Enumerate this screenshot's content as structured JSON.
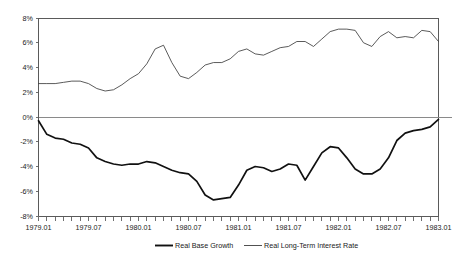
{
  "chart_data": {
    "type": "line",
    "title": "",
    "xlabel": "",
    "ylabel": "",
    "ylim": [
      -8,
      8
    ],
    "ytick_labels": [
      "8%",
      "6%",
      "4%",
      "2%",
      "0%",
      "-2%",
      "-4%",
      "-6%",
      "-8%"
    ],
    "ytick_values": [
      8,
      6,
      4,
      2,
      0,
      -2,
      -4,
      -6,
      -8
    ],
    "grid": false,
    "zero_line": true,
    "legend_position": "bottom",
    "x_axis_label_step_months": 6,
    "x_tick_step_months": 1,
    "xtick_labels": [
      "1979.01",
      "1979.07",
      "1980.01",
      "1980.07",
      "1981.01",
      "1981.07",
      "1982.01",
      "1982.07",
      "1983.01"
    ],
    "x": [
      "1979.01",
      "1979.02",
      "1979.03",
      "1979.04",
      "1979.05",
      "1979.06",
      "1979.07",
      "1979.08",
      "1979.09",
      "1979.10",
      "1979.11",
      "1979.12",
      "1980.01",
      "1980.02",
      "1980.03",
      "1980.04",
      "1980.05",
      "1980.06",
      "1980.07",
      "1980.08",
      "1980.09",
      "1980.10",
      "1980.11",
      "1980.12",
      "1981.01",
      "1981.02",
      "1981.03",
      "1981.04",
      "1981.05",
      "1981.06",
      "1981.07",
      "1981.08",
      "1981.09",
      "1981.10",
      "1981.11",
      "1981.12",
      "1982.01",
      "1982.02",
      "1982.03",
      "1982.04",
      "1982.05",
      "1982.06",
      "1982.07",
      "1982.08",
      "1982.09",
      "1982.10",
      "1982.11",
      "1982.12",
      "1983.01"
    ],
    "series": [
      {
        "name": "Real Base Growth",
        "color": "#111111",
        "line_width": "thick",
        "values": [
          -0.3,
          -1.4,
          -1.7,
          -1.8,
          -2.1,
          -2.2,
          -2.5,
          -3.3,
          -3.6,
          -3.8,
          -3.9,
          -3.8,
          -3.8,
          -3.6,
          -3.7,
          -4.0,
          -4.3,
          -4.5,
          -4.6,
          -5.2,
          -6.3,
          -6.7,
          -6.6,
          -6.5,
          -5.5,
          -4.3,
          -4.0,
          -4.1,
          -4.4,
          -4.2,
          -3.8,
          -3.9,
          -5.1,
          -4.0,
          -2.9,
          -2.4,
          -2.5,
          -3.3,
          -4.2,
          -4.6,
          -4.6,
          -4.2,
          -3.3,
          -1.9,
          -1.3,
          -1.1,
          -1.0,
          -0.8,
          -0.2
        ]
      },
      {
        "name": "Real Long-Term Interest Rate",
        "color": "#3d3d3d",
        "line_width": "thin",
        "values": [
          2.7,
          2.7,
          2.7,
          2.8,
          2.9,
          2.9,
          2.7,
          2.3,
          2.1,
          2.2,
          2.6,
          3.1,
          3.5,
          4.3,
          5.5,
          5.8,
          4.4,
          3.3,
          3.1,
          3.6,
          4.2,
          4.4,
          4.4,
          4.7,
          5.3,
          5.5,
          5.1,
          5.0,
          5.3,
          5.6,
          5.7,
          6.1,
          6.1,
          5.7,
          6.3,
          6.9,
          7.1,
          7.1,
          7.0,
          6.0,
          5.7,
          6.5,
          6.9,
          6.4,
          6.5,
          6.4,
          7.0,
          6.9,
          6.1
        ]
      }
    ],
    "final_convergence_note": ""
  },
  "legend": {
    "items": [
      {
        "label": "Real Base Growth"
      },
      {
        "label": "Real Long-Term Interest Rate"
      }
    ]
  }
}
